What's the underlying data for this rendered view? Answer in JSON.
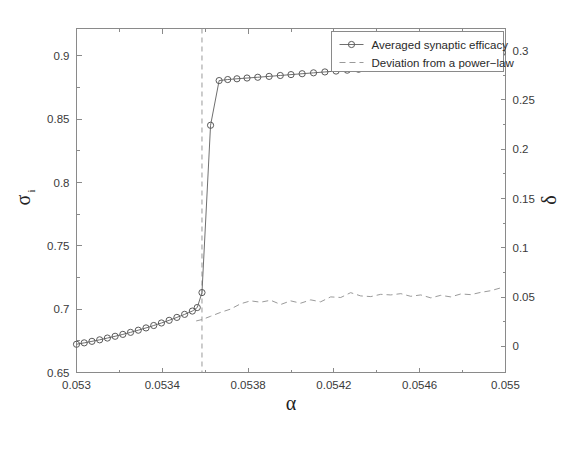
{
  "chart_data": {
    "type": "line",
    "title": "",
    "xlabel": "α",
    "ylabel": "σ",
    "ylabel_sub": "i",
    "ylabel_right": "δ",
    "xlim": [
      0.053,
      0.055
    ],
    "ylim": [
      0.65,
      0.9216
    ],
    "ylim_right": [
      -0.0265,
      0.3225
    ],
    "xticks": [
      0.053,
      0.0534,
      0.0538,
      0.0542,
      0.0546,
      0.055
    ],
    "xticklabels": [
      "0.053",
      "0.0534",
      "0.0538",
      "0.0542",
      "0.0546",
      "0.055"
    ],
    "yticks": [
      0.65,
      0.7,
      0.75,
      0.8,
      0.85,
      0.9
    ],
    "yticklabels": [
      "0.65",
      "0.7",
      "0.75",
      "0.8",
      "0.85",
      "0.9"
    ],
    "yticks_minor": [
      0.675,
      0.725,
      0.775,
      0.825,
      0.875
    ],
    "yticks_right": [
      0,
      0.05,
      0.1,
      0.15,
      0.2,
      0.25,
      0.3
    ],
    "yticklabels_right": [
      "0",
      "0.05",
      "0.1",
      "0.15",
      "0.2",
      "0.25",
      "0.3"
    ],
    "grid": false,
    "legend_position": "top-right",
    "annotations": [
      {
        "name": "transition-vline",
        "type": "vertical-dashed-line",
        "x": 0.053585
      }
    ],
    "series": [
      {
        "name": "Averaged synaptic efficacy",
        "axis": "left",
        "style": "solid-with-circle-markers",
        "marker": "circle",
        "color": "#5a5a5a",
        "x": [
          0.053,
          0.053036,
          0.053072,
          0.053108,
          0.053144,
          0.05318,
          0.053216,
          0.053252,
          0.053288,
          0.053324,
          0.05336,
          0.053396,
          0.053432,
          0.053468,
          0.053504,
          0.05354,
          0.053563,
          0.053585,
          0.053625,
          0.053665,
          0.053705,
          0.053748,
          0.053795,
          0.053845,
          0.053898,
          0.05395,
          0.054,
          0.054052,
          0.054105,
          0.054158,
          0.05421,
          0.054262,
          0.054315,
          0.054368,
          0.05442,
          0.054472,
          0.054525,
          0.054578,
          0.05463,
          0.054682,
          0.054735,
          0.054788,
          0.05484,
          0.054892,
          0.054945,
          0.054985
        ],
        "y": [
          0.6723,
          0.6734,
          0.6746,
          0.6758,
          0.6772,
          0.6786,
          0.6801,
          0.6817,
          0.6834,
          0.6852,
          0.6871,
          0.6891,
          0.6912,
          0.6935,
          0.6959,
          0.6985,
          0.7013,
          0.7131,
          0.8452,
          0.8805,
          0.8813,
          0.8819,
          0.8825,
          0.8831,
          0.8838,
          0.8845,
          0.8852,
          0.8859,
          0.8866,
          0.8873,
          0.888,
          0.8887,
          0.8894,
          0.8901,
          0.8908,
          0.8915,
          0.8922,
          0.8929,
          0.8936,
          0.8943,
          0.895,
          0.8957,
          0.8964,
          0.8975,
          0.8995,
          0.9025
        ]
      },
      {
        "name": "Deviation from a power−law",
        "axis": "right",
        "style": "dashed",
        "marker": "none",
        "color": "#9a9a9a",
        "x": [
          0.053558,
          0.053585,
          0.053625,
          0.053672,
          0.053718,
          0.053765,
          0.053812,
          0.053858,
          0.053905,
          0.053952,
          0.053998,
          0.054045,
          0.054092,
          0.054138,
          0.054185,
          0.054232,
          0.054278,
          0.054325,
          0.054372,
          0.054418,
          0.054465,
          0.054512,
          0.054558,
          0.054605,
          0.054652,
          0.054698,
          0.054745,
          0.054792,
          0.054838,
          0.054885,
          0.054932,
          0.054985
        ],
        "y": [
          0.0258,
          0.0272,
          0.0305,
          0.0345,
          0.0378,
          0.0432,
          0.0462,
          0.0448,
          0.0468,
          0.0425,
          0.0462,
          0.0438,
          0.0472,
          0.0452,
          0.0502,
          0.0496,
          0.0545,
          0.0512,
          0.0505,
          0.0528,
          0.0522,
          0.0535,
          0.0508,
          0.0522,
          0.0492,
          0.0518,
          0.0502,
          0.0532,
          0.0525,
          0.0548,
          0.0565,
          0.0598
        ]
      }
    ]
  },
  "legend": {
    "entries": [
      {
        "label": "Averaged synaptic efficacy",
        "marker": "circle-with-line"
      },
      {
        "label": "Deviation from a power−law",
        "marker": "dashed-line"
      }
    ]
  }
}
